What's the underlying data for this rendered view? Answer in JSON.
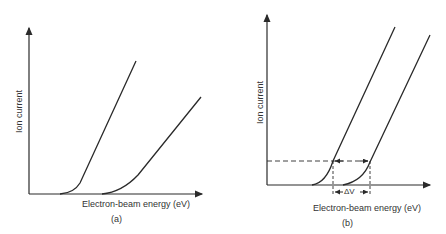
{
  "panels": [
    {
      "id": "a",
      "caption": "(a)",
      "xlabel": "Electron-beam energy (eV)",
      "ylabel": "Ion current",
      "curves": 2
    },
    {
      "id": "b",
      "caption": "(b)",
      "xlabel": "Electron-beam energy (eV)",
      "ylabel": "Ion current",
      "curves": 2,
      "annotation": "ΔV"
    }
  ],
  "colors": {
    "line": "#2a2a2a",
    "background": "#ffffff"
  }
}
